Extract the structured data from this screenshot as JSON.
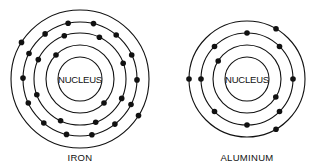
{
  "diagram": {
    "atoms": [
      {
        "name": "IRON",
        "nucleus_label": "NUCLEUS",
        "center": [
          80,
          79
        ],
        "nucleus_radius": 22,
        "shells": [
          {
            "radius": 34,
            "electrons": 2,
            "start_angle": 225
          },
          {
            "radius": 46,
            "electrons": 8,
            "start_angle": 250
          },
          {
            "radius": 57,
            "electrons": 14,
            "start_angle": 258
          },
          {
            "radius": 69,
            "electrons": 2,
            "start_angle": 212
          }
        ]
      },
      {
        "name": "ALUMINUM",
        "nucleus_label": "NUCLEUS",
        "center": [
          247,
          79
        ],
        "nucleus_radius": 22,
        "shells": [
          {
            "radius": 34,
            "electrons": 2,
            "start_angle": 212
          },
          {
            "radius": 46,
            "electrons": 8,
            "start_angle": 180
          },
          {
            "radius": 58,
            "electrons": 3,
            "start_angle": 180
          }
        ]
      }
    ]
  }
}
